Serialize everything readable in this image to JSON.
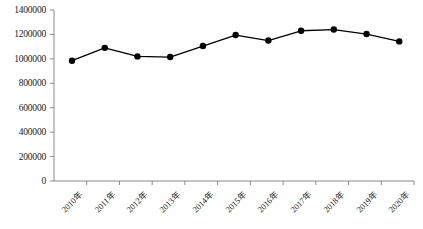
{
  "chart_data": {
    "type": "line",
    "title": "",
    "subtitle": "",
    "xlabel": "",
    "ylabel": "",
    "categories": [
      "2010年",
      "2011年",
      "2012年",
      "2013年",
      "2014年",
      "2015年",
      "2016年",
      "2017年",
      "2018年",
      "2019年",
      "2020年"
    ],
    "series": [
      {
        "name": "",
        "values": [
          985000,
          1090000,
          1020000,
          1015000,
          1105000,
          1195000,
          1150000,
          1230000,
          1240000,
          1203000,
          1143000
        ]
      }
    ],
    "ylim": [
      0,
      1400000
    ],
    "ytick_values": [
      0,
      200000,
      400000,
      600000,
      800000,
      1000000,
      1200000,
      1400000
    ],
    "ytick_labels": [
      "0",
      "200000",
      "400000",
      "600000",
      "800000",
      "1000000",
      "1200000",
      "1400000"
    ],
    "grid": false,
    "legend": "none",
    "marker": "filled-circle",
    "line_color": "#000000",
    "marker_color": "#000000",
    "axis_color": "#808080",
    "background": "#ffffff"
  }
}
